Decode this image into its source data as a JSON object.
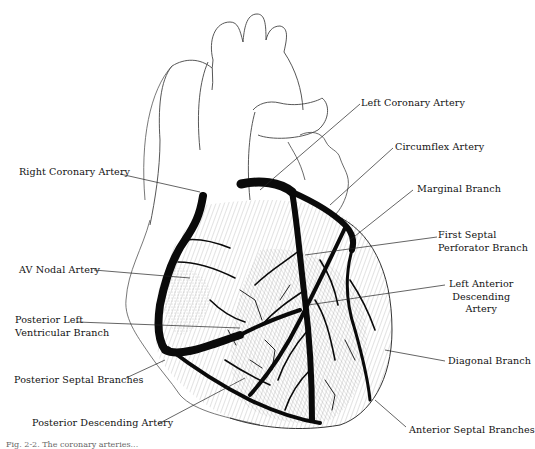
{
  "figure": {
    "caption_partial": "Fig. 2-2. The coronary arteries..."
  },
  "labels": {
    "left_coronary_artery": "Left Coronary Artery",
    "circumflex_artery": "Circumflex Artery",
    "marginal_branch": "Marginal Branch",
    "first_septal_line1": "First Septal",
    "first_septal_line2": "Perforator Branch",
    "lad_line1": "Left Anterior",
    "lad_line2": "Descending",
    "lad_line3": "Artery",
    "diagonal_branch": "Diagonal Branch",
    "anterior_septal_branches": "Anterior Septal Branches",
    "right_coronary_artery": "Right Coronary Artery",
    "av_nodal_artery": "AV Nodal Artery",
    "plv_line1": "Posterior Left",
    "plv_line2": "Ventricular Branch",
    "posterior_septal_branches": "Posterior Septal Branches",
    "posterior_descending_artery": "Posterior Descending Artery"
  },
  "colors": {
    "ink": "#111111",
    "outline": "#444444",
    "background": "#ffffff"
  }
}
